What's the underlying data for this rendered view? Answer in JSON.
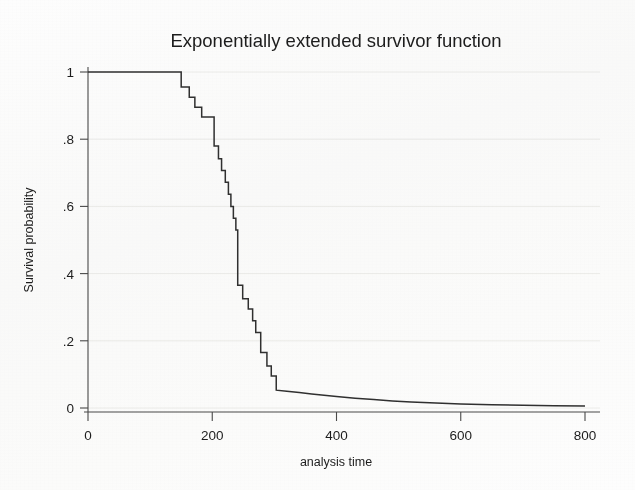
{
  "figure": {
    "background_color": "#fdfdfd",
    "line_color": "#303030",
    "text_color": "#1d1d1d",
    "axis_color": "#4a4a4a",
    "grid_color": "#e9e9e6"
  },
  "chart_data": {
    "type": "line",
    "title": "Exponentially extended survivor function",
    "xlabel": "analysis time",
    "ylabel": "Survival probability",
    "xlim": [
      0,
      800
    ],
    "ylim": [
      0,
      1
    ],
    "xticks": [
      0,
      200,
      400,
      600,
      800
    ],
    "xtick_labels": [
      "0",
      "200",
      "400",
      "600",
      "800"
    ],
    "yticks": [
      0,
      0.2,
      0.4,
      0.6,
      0.8,
      1
    ],
    "ytick_labels": [
      "0",
      ".2",
      ".4",
      ".6",
      ".8",
      "1"
    ],
    "grid": "horizontal-faint",
    "legend": "none",
    "series": [
      {
        "name": "Exponentially extended survivor function",
        "style": "step-then-smooth",
        "step_points": [
          [
            0,
            1.0
          ],
          [
            150,
            1.0
          ],
          [
            150,
            0.955
          ],
          [
            163,
            0.955
          ],
          [
            163,
            0.925
          ],
          [
            172,
            0.925
          ],
          [
            172,
            0.895
          ],
          [
            183,
            0.895
          ],
          [
            183,
            0.866
          ],
          [
            203,
            0.866
          ],
          [
            203,
            0.78
          ],
          [
            210,
            0.78
          ],
          [
            210,
            0.742
          ],
          [
            215,
            0.742
          ],
          [
            215,
            0.707
          ],
          [
            221,
            0.707
          ],
          [
            221,
            0.672
          ],
          [
            226,
            0.672
          ],
          [
            226,
            0.636
          ],
          [
            230,
            0.636
          ],
          [
            230,
            0.6
          ],
          [
            234,
            0.6
          ],
          [
            234,
            0.565
          ],
          [
            238,
            0.565
          ],
          [
            238,
            0.53
          ],
          [
            241,
            0.53
          ],
          [
            241,
            0.365
          ],
          [
            249,
            0.365
          ],
          [
            249,
            0.325
          ],
          [
            258,
            0.325
          ],
          [
            258,
            0.295
          ],
          [
            265,
            0.295
          ],
          [
            265,
            0.26
          ],
          [
            270,
            0.26
          ],
          [
            270,
            0.225
          ],
          [
            278,
            0.225
          ],
          [
            278,
            0.165
          ],
          [
            288,
            0.165
          ],
          [
            288,
            0.125
          ],
          [
            295,
            0.125
          ],
          [
            295,
            0.095
          ],
          [
            303,
            0.095
          ],
          [
            303,
            0.053
          ]
        ],
        "tail_points": [
          [
            303,
            0.053
          ],
          [
            320,
            0.05
          ],
          [
            340,
            0.046
          ],
          [
            360,
            0.042
          ],
          [
            380,
            0.038
          ],
          [
            400,
            0.034
          ],
          [
            430,
            0.029
          ],
          [
            460,
            0.025
          ],
          [
            490,
            0.021
          ],
          [
            520,
            0.018
          ],
          [
            560,
            0.015
          ],
          [
            600,
            0.012
          ],
          [
            650,
            0.01
          ],
          [
            700,
            0.008
          ],
          [
            750,
            0.007
          ],
          [
            800,
            0.006
          ]
        ]
      }
    ],
    "annotations": []
  }
}
